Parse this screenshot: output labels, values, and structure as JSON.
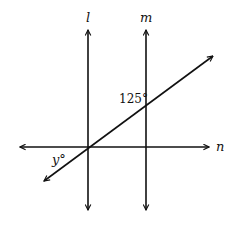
{
  "diagram": {
    "title": "",
    "lines": [
      {
        "id": "l",
        "label": "l",
        "type": "vertical"
      },
      {
        "id": "m",
        "label": "m",
        "type": "vertical"
      },
      {
        "id": "n",
        "label": "n",
        "type": "horizontal"
      },
      {
        "id": "t",
        "label": "",
        "type": "transversal"
      }
    ],
    "angles": {
      "known": "125°",
      "unknown": "y°"
    },
    "stroke_color": "#111111",
    "background": "#ffffff"
  }
}
